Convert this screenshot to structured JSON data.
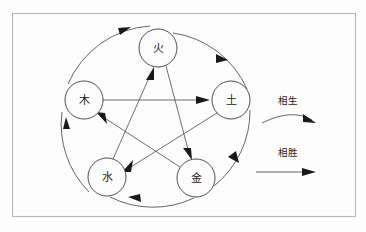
{
  "page": {
    "width": 366,
    "height": 232,
    "background_color": "#ffffff"
  },
  "frame": {
    "stroke_color": "#b9b9b9",
    "x": 12,
    "y": 13,
    "width": 344,
    "height": 204
  },
  "nodes": [
    {
      "id": "fire",
      "label": "火",
      "cx": 158,
      "cy": 48,
      "r": 19
    },
    {
      "id": "earth",
      "label": "土",
      "cx": 231,
      "cy": 100,
      "r": 19
    },
    {
      "id": "metal",
      "label": "金",
      "cx": 196,
      "cy": 178,
      "r": 19
    },
    {
      "id": "water",
      "label": "水",
      "cx": 107,
      "cy": 177,
      "r": 19
    },
    {
      "id": "wood",
      "label": "木",
      "cx": 84,
      "cy": 100,
      "r": 19
    }
  ],
  "generation_cycle": {
    "name": "相生",
    "description": "outer clockwise arcs",
    "edges": [
      {
        "from": "wood",
        "to": "fire"
      },
      {
        "from": "fire",
        "to": "earth"
      },
      {
        "from": "earth",
        "to": "metal"
      },
      {
        "from": "metal",
        "to": "water"
      },
      {
        "from": "water",
        "to": "wood"
      }
    ]
  },
  "overcoming_cycle": {
    "name": "相胜",
    "description": "inner pentagram straight arrows",
    "edges": [
      {
        "from": "wood",
        "to": "earth"
      },
      {
        "from": "earth",
        "to": "water"
      },
      {
        "from": "water",
        "to": "fire"
      },
      {
        "from": "fire",
        "to": "metal"
      },
      {
        "from": "metal",
        "to": "wood"
      }
    ]
  },
  "legend": {
    "items": [
      {
        "id": "generation",
        "label": "相生",
        "marker": "curved-arrow"
      },
      {
        "id": "overcoming",
        "label": "相胜",
        "marker": "straight-arrow"
      }
    ]
  },
  "colors": {
    "stroke": "#4a4a4a",
    "frame": "#b9b9b9",
    "text": "#1c1c1c",
    "arrow": "#1a1a1a",
    "background": "#ffffff"
  }
}
